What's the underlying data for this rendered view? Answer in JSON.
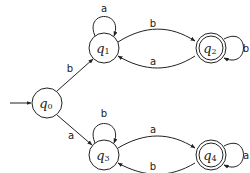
{
  "diagram": {
    "type": "deterministic-finite-automaton",
    "colors": {
      "stroke": "#222222",
      "fill": "#ffffff",
      "text": "#222222"
    },
    "states": [
      {
        "id": "q0",
        "symbol": "q",
        "sub": "0",
        "cx": 47,
        "cy": 103,
        "r": 15,
        "initial": true,
        "accepting": false
      },
      {
        "id": "q1",
        "symbol": "q",
        "sub": "1",
        "cx": 104,
        "cy": 48,
        "r": 15,
        "initial": false,
        "accepting": false
      },
      {
        "id": "q2",
        "symbol": "q",
        "sub": "2",
        "cx": 211,
        "cy": 48,
        "r": 15,
        "initial": false,
        "accepting": true
      },
      {
        "id": "q3",
        "symbol": "q",
        "sub": "3",
        "cx": 104,
        "cy": 155,
        "r": 15,
        "initial": false,
        "accepting": false
      },
      {
        "id": "q4",
        "symbol": "q",
        "sub": "4",
        "cx": 211,
        "cy": 155,
        "r": 15,
        "initial": false,
        "accepting": true
      }
    ],
    "transitions": [
      {
        "from": "q0",
        "to": "q1",
        "label": "b"
      },
      {
        "from": "q0",
        "to": "q3",
        "label": "a"
      },
      {
        "from": "q1",
        "to": "q1",
        "label": "a"
      },
      {
        "from": "q1",
        "to": "q2",
        "label": "b"
      },
      {
        "from": "q2",
        "to": "q1",
        "label": "a"
      },
      {
        "from": "q2",
        "to": "q2",
        "label": "b"
      },
      {
        "from": "q3",
        "to": "q3",
        "label": "b"
      },
      {
        "from": "q3",
        "to": "q4",
        "label": "a"
      },
      {
        "from": "q4",
        "to": "q3",
        "label": "b"
      },
      {
        "from": "q4",
        "to": "q4",
        "label": "a"
      }
    ],
    "labels": {
      "q0": "q",
      "q0_sub": "0",
      "q1": "q",
      "q1_sub": "1",
      "q2": "q",
      "q2_sub": "2",
      "q3": "q",
      "q3_sub": "3",
      "q4": "q",
      "q4_sub": "4",
      "t_q0_q1": "b",
      "t_q0_q3": "a",
      "t_q1_q1": "a",
      "t_q1_q2": "b",
      "t_q2_q1": "a",
      "t_q2_q2": "b",
      "t_q3_q3": "b",
      "t_q3_q4": "a",
      "t_q4_q3": "b",
      "t_q4_q4": "a"
    }
  }
}
